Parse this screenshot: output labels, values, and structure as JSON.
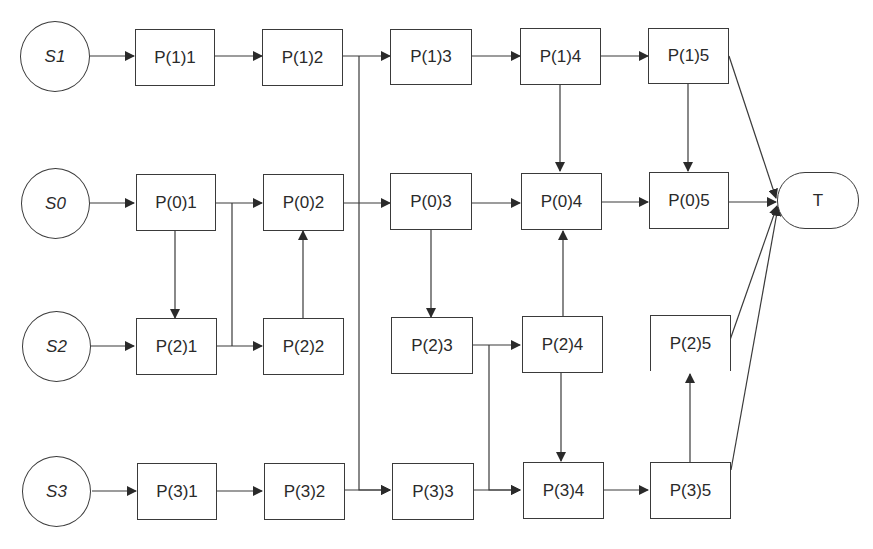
{
  "diagram": {
    "type": "flow-network",
    "sources": [
      {
        "id": "S1",
        "label": "S1",
        "row": 0
      },
      {
        "id": "S0",
        "label": "S0",
        "row": 1
      },
      {
        "id": "S2",
        "label": "S2",
        "row": 2
      },
      {
        "id": "S3",
        "label": "S3",
        "row": 3
      }
    ],
    "terminal": {
      "id": "T",
      "label": "T"
    },
    "rows": [
      {
        "row": 0,
        "nodes": [
          "P(1)1",
          "P(1)2",
          "P(1)3",
          "P(1)4",
          "P(1)5"
        ]
      },
      {
        "row": 1,
        "nodes": [
          "P(0)1",
          "P(0)2",
          "P(0)3",
          "P(0)4",
          "P(0)5"
        ]
      },
      {
        "row": 2,
        "nodes": [
          "P(2)1",
          "P(2)2",
          "P(2)3",
          "P(2)4",
          "P(2)5"
        ]
      },
      {
        "row": 3,
        "nodes": [
          "P(3)1",
          "P(3)2",
          "P(3)3",
          "P(3)4",
          "P(3)5"
        ]
      }
    ],
    "edges": [
      [
        "S1",
        "P(1)1"
      ],
      [
        "P(1)1",
        "P(1)2"
      ],
      [
        "P(1)2",
        "P(1)3"
      ],
      [
        "P(1)2",
        "P(3)3"
      ],
      [
        "P(1)3",
        "P(1)4"
      ],
      [
        "P(1)4",
        "P(1)5"
      ],
      [
        "P(1)4",
        "P(0)4"
      ],
      [
        "P(1)5",
        "P(0)5"
      ],
      [
        "P(1)5",
        "T"
      ],
      [
        "S0",
        "P(0)1"
      ],
      [
        "P(0)1",
        "P(0)2"
      ],
      [
        "P(0)1",
        "P(2)1"
      ],
      [
        "P(0)1",
        "P(2)2"
      ],
      [
        "P(0)2",
        "P(0)3"
      ],
      [
        "P(0)3",
        "P(0)4"
      ],
      [
        "P(0)3",
        "P(2)3"
      ],
      [
        "P(0)4",
        "P(0)5"
      ],
      [
        "P(0)5",
        "T"
      ],
      [
        "S2",
        "P(2)1"
      ],
      [
        "P(2)1",
        "P(2)2"
      ],
      [
        "P(2)2",
        "P(0)2"
      ],
      [
        "P(2)3",
        "P(2)4"
      ],
      [
        "P(2)3",
        "P(3)4"
      ],
      [
        "P(2)4",
        "P(0)4"
      ],
      [
        "P(2)4",
        "P(3)4"
      ],
      [
        "P(2)5",
        "T"
      ],
      [
        "S3",
        "P(3)1"
      ],
      [
        "P(3)1",
        "P(3)2"
      ],
      [
        "P(3)2",
        "P(3)3"
      ],
      [
        "P(3)3",
        "P(3)4"
      ],
      [
        "P(3)4",
        "P(3)5"
      ],
      [
        "P(3)5",
        "P(2)5"
      ],
      [
        "P(3)5",
        "T"
      ]
    ],
    "colors": {
      "stroke": "#3a3a3a",
      "text": "#2a2a2a",
      "background": "#ffffff"
    }
  }
}
